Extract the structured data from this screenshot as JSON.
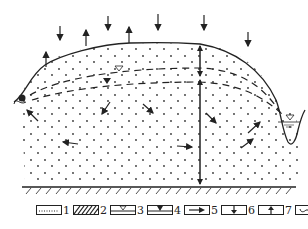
{
  "diagram": {
    "type": "hydrogeological cross-section",
    "colors": {
      "ink": "#222222",
      "background": "#ffffff"
    },
    "surface_arrows": {
      "down": [
        {
          "x": 60,
          "y": 35
        },
        {
          "x": 108,
          "y": 25
        },
        {
          "x": 158,
          "y": 25
        },
        {
          "x": 204,
          "y": 22
        },
        {
          "x": 248,
          "y": 40
        }
      ],
      "up": [
        {
          "x": 45,
          "y": 55
        },
        {
          "x": 86,
          "y": 35
        },
        {
          "x": 128,
          "y": 40
        }
      ]
    },
    "flow_arrows": [
      "up-left toward spring",
      "down-left",
      "down-right",
      "left",
      "right",
      "down-right",
      "up-right toward river",
      "up-right toward river"
    ],
    "thickness_arrows": [
      "upper layer vertical double arrow",
      "lower saturated zone vertical double arrow"
    ]
  },
  "legend": {
    "items": [
      {
        "num": "1",
        "symbol": "dotted-line"
      },
      {
        "num": "2",
        "symbol": "hatched-impermeable"
      },
      {
        "num": "3",
        "symbol": "water-table-open-triangle"
      },
      {
        "num": "4",
        "symbol": "water-table-filled-triangle"
      },
      {
        "num": "5",
        "symbol": "flow-arrow-right"
      },
      {
        "num": "6",
        "symbol": "arrow-down"
      },
      {
        "num": "7",
        "symbol": "arrow-up"
      },
      {
        "num": "8",
        "symbol": "spring"
      }
    ]
  }
}
